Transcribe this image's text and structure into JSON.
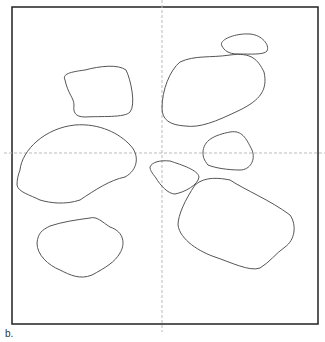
{
  "figure": {
    "label": "b.",
    "frame": {
      "x": 12,
      "y": 7,
      "w": 306,
      "h": 317
    },
    "crosshair": {
      "x": 162,
      "y": 153,
      "color": "#bbbbbb"
    },
    "stroke_color": "#555555",
    "shapes": [
      {
        "id": "blob-top-right-small",
        "path": "M222,46 C218,40 235,33 250,34 C262,35 270,45 267,51 C264,55 250,54 238,54 C228,54 224,50 222,46 Z"
      },
      {
        "id": "blob-upper-right-large",
        "path": "M162,108 C162,90 170,70 180,62 C195,55 210,58 230,55 C252,52 258,60 264,72 C268,90 260,100 240,110 C215,122 200,128 185,126 C170,125 162,120 162,108 Z"
      },
      {
        "id": "blob-upper-left",
        "path": "M65,80 C62,74 70,72 85,70 C100,66 118,64 126,70 C131,80 136,105 130,112 C125,118 100,116 85,117 C75,117 73,112 74,105 C74,98 68,94 65,80 Z"
      },
      {
        "id": "blob-left-large",
        "path": "M20,170 C22,150 45,128 75,125 C100,123 120,134 130,145 C140,155 138,170 125,177 C110,180 95,190 80,200 C65,205 50,203 40,200 C30,195 18,192 17,185 C17,180 18,175 20,170 Z"
      },
      {
        "id": "blob-right-mid-small",
        "path": "M203,153 C203,140 215,135 230,132 C242,130 246,138 252,150 C256,160 250,170 240,170 C228,170 215,168 208,165 C204,160 203,157 203,153 Z"
      },
      {
        "id": "blob-center-small",
        "path": "M150,167 C152,162 160,160 170,161 C182,165 198,170 199,177 C198,185 185,192 175,194 C168,194 160,185 156,178 C152,173 150,170 150,167 Z"
      },
      {
        "id": "blob-lower-right-large",
        "path": "M178,225 C178,215 185,200 195,185 C205,176 220,178 230,180 C245,190 270,200 290,215 C297,225 295,240 285,247 C275,254 270,262 260,268 C250,272 230,262 215,257 C200,252 180,240 178,225 Z"
      },
      {
        "id": "blob-lower-left",
        "path": "M37,243 C38,233 42,230 50,226 C62,222 75,220 90,218 C97,216 102,222 110,227 C125,232 125,245 120,253 C115,262 105,268 92,275 C80,280 70,275 60,270 C48,265 37,255 37,243 Z"
      }
    ]
  }
}
